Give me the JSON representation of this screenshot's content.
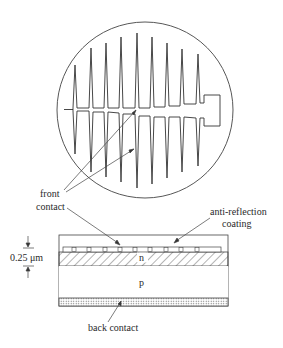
{
  "figure": {
    "type": "solar cell structure diagram",
    "top_view": {
      "shape": "circular wafer",
      "grid": "comb-shaped front contact with tapered fingers and busbar pad",
      "fingers_top": 9,
      "fingers_bottom": 9
    },
    "cross_section": {
      "layers": [
        {
          "name": "anti-reflection coating",
          "label": ""
        },
        {
          "name": "n",
          "label": "n"
        },
        {
          "name": "p",
          "label": "p"
        },
        {
          "name": "back contact",
          "label": ""
        }
      ]
    },
    "labels": {
      "front_contact_line1": "front",
      "front_contact_line2": "contact",
      "anti_reflection_line1": "anti-reflection",
      "anti_reflection_line2": "coating",
      "n_layer": "n",
      "p_layer": "p",
      "back_contact": "back contact",
      "dimension": "0.25 μm"
    },
    "colors": {
      "line": "#333333",
      "background": "#ffffff"
    }
  }
}
